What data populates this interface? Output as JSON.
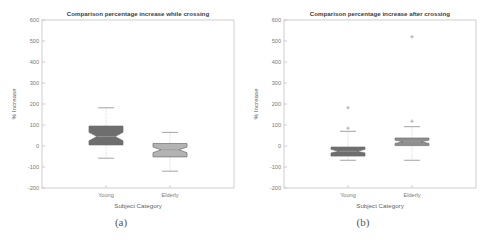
{
  "figure": {
    "panel_a_caption": "(a)",
    "panel_b_caption": "(b)"
  },
  "chart_data": [
    {
      "type": "box",
      "panel": "a",
      "title": "Comparison percentage increase while crossing",
      "xlabel": "Subject Category",
      "ylabel": "% Increase",
      "categories": [
        "Young",
        "Elderly"
      ],
      "ylim": [
        -200,
        600
      ],
      "yticks": [
        -200,
        -100,
        0,
        100,
        200,
        300,
        400,
        500,
        600
      ],
      "ytick_labels": [
        "-200",
        "-100",
        "0",
        "100",
        "200",
        "300",
        "400",
        "500",
        "600"
      ],
      "grid": false,
      "legend": "none",
      "boxes": [
        {
          "name": "Young",
          "whisker_low": -58,
          "q1": 5,
          "median": 45,
          "q3": 95,
          "whisker_high": 182,
          "notch_low": 25,
          "notch_high": 65,
          "fill": "#6e6e6e",
          "outliers": []
        },
        {
          "name": "Elderly",
          "whisker_low": -120,
          "q1": -52,
          "median": -18,
          "q3": 12,
          "whisker_high": 65,
          "notch_low": -32,
          "notch_high": -5,
          "fill": "#b3b3b3",
          "outliers": []
        }
      ]
    },
    {
      "type": "box",
      "panel": "b",
      "title": "Comparison percentage increase after crossing",
      "xlabel": "Subject Category",
      "ylabel": "% Increase",
      "categories": [
        "Young",
        "Elderly"
      ],
      "ylim": [
        -200,
        600
      ],
      "yticks": [
        -200,
        -100,
        0,
        100,
        200,
        300,
        400,
        500,
        600
      ],
      "ytick_labels": [
        "-200",
        "-100",
        "0",
        "100",
        "200",
        "300",
        "400",
        "500",
        "600"
      ],
      "grid": false,
      "legend": "none",
      "boxes": [
        {
          "name": "Young",
          "whisker_low": -68,
          "q1": -48,
          "median": -25,
          "q3": -5,
          "whisker_high": 70,
          "notch_low": -33,
          "notch_high": -16,
          "fill": "#6e6e6e",
          "outliers": [
            85,
            182
          ]
        },
        {
          "name": "Elderly",
          "whisker_low": -68,
          "q1": 2,
          "median": 20,
          "q3": 38,
          "whisker_high": 92,
          "notch_low": 12,
          "notch_high": 28,
          "fill": "#8f8f8f",
          "outliers": [
            118,
            520
          ]
        }
      ]
    }
  ]
}
